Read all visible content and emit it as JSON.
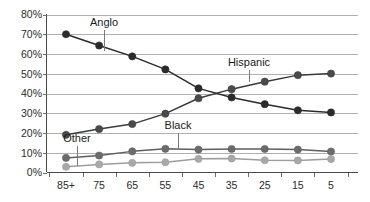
{
  "chart_data": {
    "type": "line",
    "title": "",
    "subtitle": "",
    "xlabel": "",
    "ylabel": "",
    "grid": true,
    "legend_position": "inline-annotations",
    "categories": [
      "85+",
      "75",
      "65",
      "55",
      "45",
      "35",
      "25",
      "15",
      "5"
    ],
    "x_tick_labels": [
      "85+",
      "75",
      "65",
      "55",
      "45",
      "35",
      "25",
      "15",
      "5"
    ],
    "y_tick_labels": [
      "0%",
      "10%",
      "20%",
      "30%",
      "40%",
      "50%",
      "60%",
      "70%",
      "80%"
    ],
    "y_ticks": [
      0,
      10,
      20,
      30,
      40,
      50,
      60,
      70,
      80
    ],
    "ylim": [
      0,
      80
    ],
    "series": [
      {
        "name": "Anglo",
        "color": "#2b2b2b",
        "marker_color": "#2b2b2b",
        "values": [
          70.0,
          64.3,
          58.8,
          52.2,
          42.6,
          38.0,
          34.6,
          31.5,
          30.4
        ]
      },
      {
        "name": "Hispanic",
        "color": "#3a3a3a",
        "marker_color": "#4a4a4a",
        "values": [
          19.1,
          22.0,
          24.5,
          29.8,
          37.6,
          42.2,
          46.0,
          49.3,
          50.1
        ]
      },
      {
        "name": "Black",
        "color": "#5e5e5e",
        "marker_color": "#6b6b6b",
        "values": [
          7.4,
          8.6,
          10.7,
          12.0,
          11.6,
          11.9,
          11.9,
          11.6,
          10.6
        ]
      },
      {
        "name": "Other",
        "color": "#9d9d9d",
        "marker_color": "#a8a8a8",
        "values": [
          2.9,
          4.1,
          4.9,
          5.2,
          6.9,
          7.1,
          6.2,
          6.1,
          6.8
        ]
      }
    ],
    "annotations": [
      {
        "text": "Anglo",
        "series": "Anglo"
      },
      {
        "text": "Hispanic",
        "series": "Hispanic"
      },
      {
        "text": "Black",
        "series": "Black"
      },
      {
        "text": "Other",
        "series": "Other"
      }
    ]
  },
  "colors": {
    "gridline": "#b0b0b0",
    "axis": "#4a4a4a",
    "background": "#ffffff",
    "text": "#2b2b2b"
  }
}
